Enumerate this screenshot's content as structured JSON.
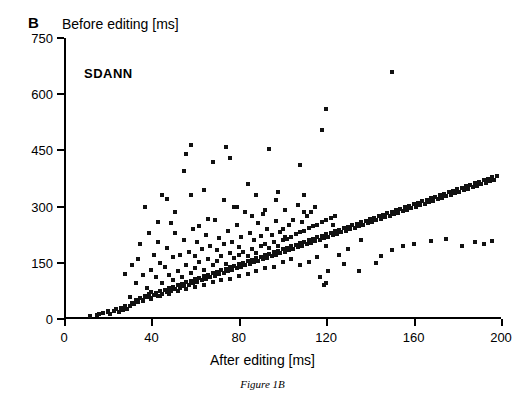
{
  "panel": {
    "letter": "B",
    "top_title": "Before editing [ms]",
    "inner_label": "SDANN",
    "caption": "Figure 1B"
  },
  "chart_data": {
    "type": "scatter",
    "title": "Before editing [ms]",
    "annotation": "SDANN",
    "xlabel": "After editing [ms]",
    "ylabel": "Before editing [ms]",
    "xlim": [
      0,
      200
    ],
    "ylim": [
      0,
      750
    ],
    "xticks": [
      0,
      40,
      80,
      120,
      160,
      200
    ],
    "yticks": [
      0,
      150,
      300,
      450,
      600,
      750
    ],
    "xtick_labels": [
      "0",
      "40",
      "80",
      "120",
      "160",
      "200"
    ],
    "ytick_labels": [
      "0",
      "150",
      "300",
      "450",
      "600",
      "750"
    ],
    "grid": false,
    "legend": null,
    "marker": {
      "shape": "square",
      "color": "#111111",
      "size_px": 4
    },
    "points": [
      [
        12,
        8
      ],
      [
        15,
        12
      ],
      [
        18,
        16
      ],
      [
        20,
        18
      ],
      [
        21,
        14
      ],
      [
        23,
        22
      ],
      [
        24,
        26
      ],
      [
        25,
        20
      ],
      [
        26,
        30
      ],
      [
        27,
        24
      ],
      [
        28,
        34
      ],
      [
        28,
        120
      ],
      [
        29,
        28
      ],
      [
        30,
        36
      ],
      [
        30,
        60
      ],
      [
        31,
        44
      ],
      [
        31,
        145
      ],
      [
        32,
        40
      ],
      [
        33,
        52
      ],
      [
        33,
        96
      ],
      [
        34,
        46
      ],
      [
        34,
        160
      ],
      [
        35,
        56
      ],
      [
        35,
        200
      ],
      [
        36,
        50
      ],
      [
        36,
        118
      ],
      [
        37,
        62
      ],
      [
        37,
        300
      ],
      [
        38,
        58
      ],
      [
        38,
        84
      ],
      [
        39,
        66
      ],
      [
        39,
        230
      ],
      [
        40,
        54
      ],
      [
        40,
        72
      ],
      [
        40,
        130
      ],
      [
        41,
        64
      ],
      [
        41,
        170
      ],
      [
        42,
        70
      ],
      [
        42,
        112
      ],
      [
        43,
        62
      ],
      [
        43,
        205
      ],
      [
        44,
        74
      ],
      [
        44,
        150
      ],
      [
        45,
        68
      ],
      [
        45,
        96
      ],
      [
        45,
        330
      ],
      [
        46,
        78
      ],
      [
        46,
        140
      ],
      [
        47,
        72
      ],
      [
        47,
        190
      ],
      [
        48,
        82
      ],
      [
        48,
        118
      ],
      [
        49,
        76
      ],
      [
        49,
        255
      ],
      [
        50,
        86
      ],
      [
        50,
        104
      ],
      [
        50,
        165
      ],
      [
        51,
        80
      ],
      [
        51,
        230
      ],
      [
        52,
        90
      ],
      [
        52,
        128
      ],
      [
        53,
        84
      ],
      [
        53,
        172
      ],
      [
        54,
        94
      ],
      [
        54,
        112
      ],
      [
        55,
        88
      ],
      [
        55,
        210
      ],
      [
        55,
        395
      ],
      [
        56,
        98
      ],
      [
        56,
        145
      ],
      [
        57,
        92
      ],
      [
        57,
        180
      ],
      [
        58,
        102
      ],
      [
        58,
        124
      ],
      [
        58,
        465
      ],
      [
        59,
        96
      ],
      [
        59,
        240
      ],
      [
        60,
        106
      ],
      [
        60,
        136
      ],
      [
        60,
        168
      ],
      [
        61,
        100
      ],
      [
        61,
        205
      ],
      [
        62,
        110
      ],
      [
        62,
        152
      ],
      [
        63,
        104
      ],
      [
        63,
        188
      ],
      [
        64,
        114
      ],
      [
        64,
        132
      ],
      [
        64,
        345
      ],
      [
        65,
        108
      ],
      [
        65,
        225
      ],
      [
        66,
        118
      ],
      [
        66,
        160
      ],
      [
        67,
        112
      ],
      [
        67,
        195
      ],
      [
        68,
        122
      ],
      [
        68,
        144
      ],
      [
        68,
        420
      ],
      [
        69,
        116
      ],
      [
        69,
        265
      ],
      [
        70,
        126
      ],
      [
        70,
        156
      ],
      [
        70,
        184
      ],
      [
        71,
        120
      ],
      [
        71,
        215
      ],
      [
        72,
        130
      ],
      [
        72,
        168
      ],
      [
        73,
        124
      ],
      [
        73,
        200
      ],
      [
        74,
        134
      ],
      [
        74,
        148
      ],
      [
        74,
        460
      ],
      [
        75,
        128
      ],
      [
        75,
        235
      ],
      [
        76,
        138
      ],
      [
        76,
        176
      ],
      [
        77,
        132
      ],
      [
        77,
        205
      ],
      [
        78,
        142
      ],
      [
        78,
        162
      ],
      [
        78,
        300
      ],
      [
        79,
        136
      ],
      [
        79,
        250
      ],
      [
        80,
        146
      ],
      [
        80,
        172
      ],
      [
        80,
        192
      ],
      [
        81,
        140
      ],
      [
        81,
        220
      ],
      [
        82,
        150
      ],
      [
        82,
        180
      ],
      [
        83,
        144
      ],
      [
        83,
        285
      ],
      [
        84,
        154
      ],
      [
        84,
        168
      ],
      [
        84,
        360
      ],
      [
        85,
        148
      ],
      [
        85,
        230
      ],
      [
        86,
        158
      ],
      [
        86,
        188
      ],
      [
        87,
        152
      ],
      [
        87,
        212
      ],
      [
        88,
        162
      ],
      [
        88,
        176
      ],
      [
        88,
        330
      ],
      [
        89,
        156
      ],
      [
        89,
        255
      ],
      [
        90,
        166
      ],
      [
        90,
        196
      ],
      [
        90,
        222
      ],
      [
        91,
        160
      ],
      [
        91,
        280
      ],
      [
        92,
        170
      ],
      [
        92,
        200
      ],
      [
        93,
        164
      ],
      [
        93,
        240
      ],
      [
        94,
        174
      ],
      [
        94,
        190
      ],
      [
        94,
        455
      ],
      [
        95,
        168
      ],
      [
        95,
        225
      ],
      [
        96,
        178
      ],
      [
        96,
        206
      ],
      [
        97,
        172
      ],
      [
        97,
        262
      ],
      [
        98,
        182
      ],
      [
        98,
        196
      ],
      [
        98,
        340
      ],
      [
        99,
        176
      ],
      [
        99,
        232
      ],
      [
        100,
        186
      ],
      [
        100,
        210
      ],
      [
        100,
        240
      ],
      [
        101,
        180
      ],
      [
        101,
        290
      ],
      [
        102,
        190
      ],
      [
        102,
        214
      ],
      [
        103,
        184
      ],
      [
        103,
        250
      ],
      [
        104,
        194
      ],
      [
        104,
        220
      ],
      [
        105,
        188
      ],
      [
        105,
        265
      ],
      [
        106,
        198
      ],
      [
        106,
        228
      ],
      [
        107,
        192
      ],
      [
        107,
        305
      ],
      [
        108,
        202
      ],
      [
        108,
        232
      ],
      [
        108,
        410
      ],
      [
        109,
        196
      ],
      [
        109,
        258
      ],
      [
        110,
        206
      ],
      [
        110,
        236
      ],
      [
        110,
        330
      ],
      [
        111,
        200
      ],
      [
        111,
        275
      ],
      [
        112,
        210
      ],
      [
        112,
        244
      ],
      [
        113,
        204
      ],
      [
        113,
        285
      ],
      [
        114,
        214
      ],
      [
        114,
        248
      ],
      [
        115,
        208
      ],
      [
        115,
        300
      ],
      [
        116,
        218
      ],
      [
        116,
        252
      ],
      [
        117,
        212
      ],
      [
        117,
        112
      ],
      [
        118,
        222
      ],
      [
        118,
        260
      ],
      [
        118,
        505
      ],
      [
        119,
        216
      ],
      [
        119,
        90
      ],
      [
        120,
        226
      ],
      [
        120,
        264
      ],
      [
        120,
        560
      ],
      [
        121,
        220
      ],
      [
        121,
        128
      ],
      [
        122,
        230
      ],
      [
        122,
        270
      ],
      [
        123,
        224
      ],
      [
        124,
        234
      ],
      [
        124,
        276
      ],
      [
        125,
        228
      ],
      [
        126,
        238
      ],
      [
        127,
        232
      ],
      [
        128,
        242
      ],
      [
        129,
        236
      ],
      [
        130,
        246
      ],
      [
        131,
        240
      ],
      [
        132,
        250
      ],
      [
        133,
        244
      ],
      [
        134,
        254
      ],
      [
        135,
        248
      ],
      [
        136,
        258
      ],
      [
        137,
        252
      ],
      [
        138,
        262
      ],
      [
        139,
        256
      ],
      [
        140,
        266
      ],
      [
        141,
        260
      ],
      [
        142,
        270
      ],
      [
        143,
        264
      ],
      [
        144,
        274
      ],
      [
        145,
        268
      ],
      [
        146,
        278
      ],
      [
        147,
        272
      ],
      [
        148,
        282
      ],
      [
        149,
        276
      ],
      [
        150,
        286
      ],
      [
        150,
        660
      ],
      [
        151,
        280
      ],
      [
        152,
        290
      ],
      [
        153,
        284
      ],
      [
        154,
        294
      ],
      [
        155,
        288
      ],
      [
        156,
        298
      ],
      [
        157,
        292
      ],
      [
        158,
        302
      ],
      [
        159,
        296
      ],
      [
        160,
        306
      ],
      [
        161,
        300
      ],
      [
        162,
        310
      ],
      [
        163,
        304
      ],
      [
        164,
        314
      ],
      [
        165,
        308
      ],
      [
        166,
        318
      ],
      [
        167,
        312
      ],
      [
        168,
        322
      ],
      [
        169,
        316
      ],
      [
        170,
        326
      ],
      [
        171,
        320
      ],
      [
        172,
        330
      ],
      [
        173,
        324
      ],
      [
        174,
        334
      ],
      [
        175,
        328
      ],
      [
        176,
        338
      ],
      [
        177,
        332
      ],
      [
        178,
        342
      ],
      [
        179,
        336
      ],
      [
        180,
        346
      ],
      [
        181,
        340
      ],
      [
        182,
        350
      ],
      [
        183,
        344
      ],
      [
        184,
        354
      ],
      [
        185,
        348
      ],
      [
        186,
        358
      ],
      [
        187,
        352
      ],
      [
        188,
        362
      ],
      [
        189,
        356
      ],
      [
        190,
        366
      ],
      [
        191,
        360
      ],
      [
        192,
        370
      ],
      [
        193,
        364
      ],
      [
        194,
        374
      ],
      [
        195,
        368
      ],
      [
        196,
        378
      ],
      [
        197,
        372
      ],
      [
        198,
        382
      ],
      [
        136,
        212
      ],
      [
        145,
        168
      ],
      [
        150,
        184
      ],
      [
        155,
        196
      ],
      [
        160,
        200
      ],
      [
        168,
        208
      ],
      [
        175,
        214
      ],
      [
        182,
        196
      ],
      [
        188,
        206
      ],
      [
        192,
        200
      ],
      [
        196,
        208
      ],
      [
        143,
        150
      ],
      [
        128,
        148
      ],
      [
        135,
        128
      ],
      [
        120,
        96
      ],
      [
        126,
        172
      ],
      [
        130,
        188
      ],
      [
        116,
        166
      ],
      [
        112,
        152
      ],
      [
        108,
        144
      ],
      [
        104,
        160
      ],
      [
        100,
        152
      ],
      [
        96,
        140
      ],
      [
        92,
        136
      ],
      [
        88,
        128
      ],
      [
        84,
        120
      ],
      [
        80,
        116
      ],
      [
        76,
        108
      ],
      [
        72,
        104
      ],
      [
        68,
        98
      ],
      [
        64,
        92
      ],
      [
        60,
        86
      ],
      [
        56,
        80
      ],
      [
        52,
        74
      ],
      [
        48,
        68
      ],
      [
        44,
        62
      ],
      [
        40,
        56
      ],
      [
        36,
        48
      ],
      [
        32,
        42
      ],
      [
        28,
        36
      ],
      [
        24,
        28
      ],
      [
        20,
        22
      ],
      [
        16,
        14
      ],
      [
        66,
        268
      ],
      [
        73,
        318
      ],
      [
        86,
        276
      ],
      [
        97,
        318
      ],
      [
        110,
        286
      ],
      [
        120,
        196
      ],
      [
        58,
        330
      ],
      [
        62,
        248
      ],
      [
        51,
        286
      ],
      [
        47,
        320
      ],
      [
        43,
        260
      ],
      [
        56,
        440
      ],
      [
        76,
        430
      ],
      [
        79,
        300
      ],
      [
        92,
        290
      ],
      [
        101,
        218
      ],
      [
        113,
        210
      ],
      [
        123,
        252
      ]
    ]
  }
}
